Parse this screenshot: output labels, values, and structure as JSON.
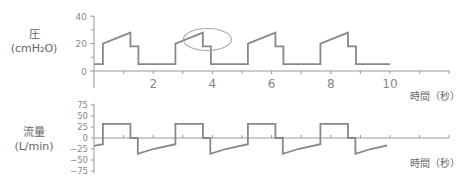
{
  "chart_data": [
    {
      "type": "line",
      "title": "",
      "ylabel": "圧 (cmH2O)",
      "ylabel_main": "圧",
      "ylabel_unit": "(cmH₂O)",
      "xlabel": "時間（秒）",
      "xlim": [
        0,
        12
      ],
      "ylim": [
        -12,
        40
      ],
      "yticks": [
        0,
        20,
        40
      ],
      "xtick_labels": [
        "2",
        "4",
        "6",
        "8",
        "10"
      ],
      "xtick_values": [
        2,
        4,
        6,
        8,
        10
      ],
      "minor_xticks": [
        1,
        3,
        5,
        7,
        9,
        11,
        12
      ],
      "minor_yticks": [
        10,
        30
      ],
      "grid": false,
      "series": [
        {
          "name": "pressure",
          "color": "#888888",
          "x": [
            0,
            0.3,
            0.3,
            1.23,
            1.23,
            1.5,
            1.5,
            2.75,
            2.75,
            3.68,
            3.68,
            3.95,
            3.95,
            5.2,
            5.2,
            6.13,
            6.13,
            6.4,
            6.4,
            7.65,
            7.65,
            8.58,
            8.58,
            8.85,
            8.85,
            10.0
          ],
          "y": [
            5,
            5,
            20,
            28,
            18,
            18,
            5,
            5,
            20,
            28,
            18,
            18,
            5,
            5,
            20,
            28,
            18,
            18,
            5,
            5,
            20,
            28,
            18,
            18,
            5,
            5
          ]
        }
      ],
      "annotations": [
        {
          "type": "ellipse",
          "center_t": 3.83,
          "center_value": 23,
          "note": "circled plateau-pressure segment of second breath"
        }
      ]
    },
    {
      "type": "line",
      "title": "",
      "ylabel": "流量 (L/min)",
      "ylabel_main": "流量",
      "ylabel_unit": "(L/min)",
      "xlabel": "時間（秒）",
      "xlim": [
        0,
        12
      ],
      "ylim": [
        -80,
        80
      ],
      "yticks": [
        75,
        50,
        25,
        0,
        -25,
        -50,
        -75
      ],
      "ytick_labels": [
        "75",
        "50",
        "25",
        "0",
        "−25",
        "−50",
        "−75"
      ],
      "grid": false,
      "series": [
        {
          "name": "flow",
          "color": "#888888",
          "x": [
            0,
            0.3,
            0.3,
            1.23,
            1.23,
            1.48,
            1.48,
            2.0,
            2.75,
            2.75,
            3.68,
            3.68,
            3.93,
            3.93,
            4.45,
            5.2,
            5.2,
            6.13,
            6.13,
            6.38,
            6.38,
            6.9,
            7.65,
            7.65,
            8.58,
            8.58,
            8.83,
            8.83,
            9.35,
            9.9
          ],
          "y": [
            -18,
            -14,
            32,
            32,
            0,
            0,
            -36,
            -25,
            -14,
            32,
            32,
            0,
            0,
            -36,
            -25,
            -14,
            32,
            32,
            0,
            0,
            -36,
            -25,
            -14,
            32,
            32,
            0,
            0,
            -36,
            -25,
            -17
          ]
        }
      ]
    }
  ],
  "labels": {
    "pressure_main": "圧",
    "pressure_unit": "(cmH₂O)",
    "flow_main": "流量",
    "flow_unit": "(L/min)",
    "time_axis": "時間（秒）",
    "time_axis_flow": "時間（秒）"
  },
  "colors": {
    "line": "#888888",
    "axis": "#999999",
    "text": "#777777",
    "annotation": "#aaaaaa"
  }
}
